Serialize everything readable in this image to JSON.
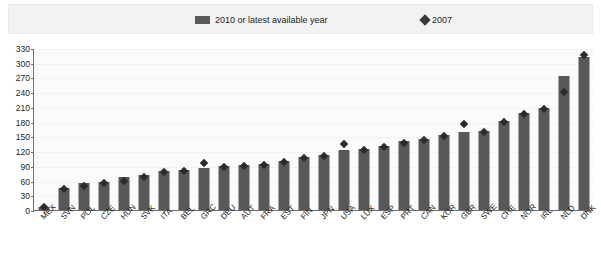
{
  "legend": {
    "position": "top",
    "entries": [
      {
        "label": "2010 or latest available year",
        "marker": "bar-swatch-icon",
        "color": "#5a5a5a"
      },
      {
        "label": "2007",
        "marker": "diamond-icon",
        "color": "#3a3a3a"
      }
    ]
  },
  "colors": {
    "bar": "#585858",
    "marker": "#2b2b2b",
    "legend_background": "#f2f2f2",
    "plot_background": "#fbfbfb",
    "axis": "#6f6f6f",
    "text": "#231f20"
  },
  "chart_data": {
    "type": "bar",
    "title": "",
    "subtitle": "",
    "xlabel": "",
    "ylabel": "",
    "ylim": [
      0,
      330
    ],
    "yticks": [
      0,
      30,
      60,
      90,
      120,
      150,
      180,
      210,
      240,
      270,
      300,
      330
    ],
    "grid": true,
    "categories": [
      "MEX",
      "SVN",
      "POL",
      "CZE",
      "HUN",
      "SVK",
      "ITA",
      "BEL",
      "GRC",
      "DEU",
      "AUT",
      "FRA",
      "EST",
      "FIN",
      "JPN",
      "USA",
      "LUX",
      "ESP",
      "PRT",
      "CAN",
      "KOR",
      "GBR",
      "SWE",
      "CHE",
      "NOR",
      "IRL",
      "NLD",
      "DNK"
    ],
    "series": [
      {
        "name": "2010 or latest available year",
        "type": "bar",
        "values": [
          7,
          45,
          55,
          58,
          68,
          72,
          80,
          82,
          85,
          90,
          92,
          94,
          100,
          108,
          113,
          123,
          125,
          130,
          140,
          145,
          152,
          158,
          160,
          182,
          197,
          208,
          272,
          312
        ]
      },
      {
        "name": "2007",
        "type": "scatter",
        "marker": "diamond",
        "values": [
          6,
          42,
          48,
          55,
          60,
          68,
          77,
          80,
          95,
          88,
          90,
          92,
          97,
          105,
          111,
          135,
          123,
          128,
          137,
          143,
          150,
          175,
          158,
          180,
          195,
          205,
          240,
          315
        ]
      }
    ]
  }
}
